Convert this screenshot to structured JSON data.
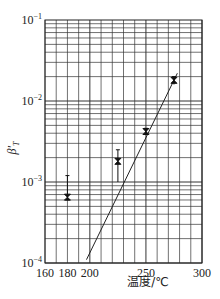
{
  "chart_data": {
    "type": "scatter",
    "title": "",
    "xlabel": "温度/℃",
    "ylabel": "β'_T",
    "xlim": [
      160,
      300
    ],
    "ylim": [
      0.0001,
      0.1
    ],
    "yscale": "log",
    "x_ticks": [
      "160",
      "180",
      "200",
      "250",
      "300"
    ],
    "y_ticks": [
      "10^-4",
      "10^-3",
      "10^-2",
      "10^-1"
    ],
    "grid": true,
    "series": [
      {
        "name": "measured",
        "x": [
          180,
          225,
          250,
          275
        ],
        "y": [
          0.00065,
          0.0018,
          0.0042,
          0.018
        ],
        "error_upper": [
          0.0012,
          0.0025,
          0.0046,
          0.02
        ],
        "error_lower": [
          0.00065,
          0.001,
          0.0038,
          0.016
        ]
      },
      {
        "name": "fit-line",
        "x": [
          197,
          278
        ],
        "y": [
          0.00011,
          0.022
        ]
      }
    ]
  }
}
